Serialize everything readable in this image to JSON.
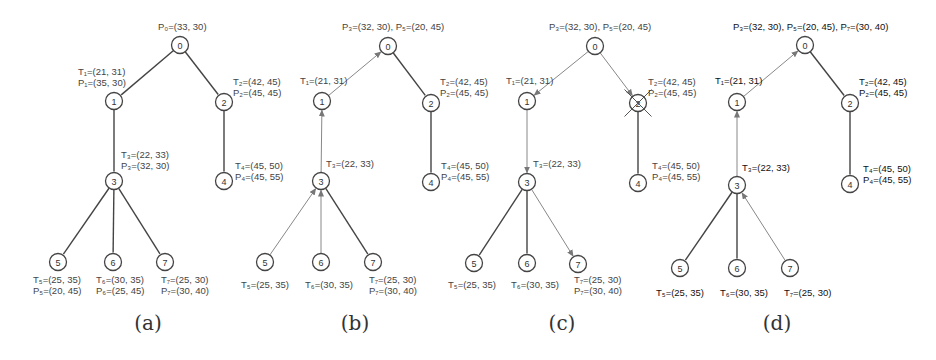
{
  "figure": {
    "panels": [
      {
        "id": "a",
        "caption": "(a)",
        "nodes": [
          {
            "id": "0",
            "x": 180,
            "y": 45
          },
          {
            "id": "1",
            "x": 114,
            "y": 101
          },
          {
            "id": "2",
            "x": 224,
            "y": 102
          },
          {
            "id": "3",
            "x": 114,
            "y": 181
          },
          {
            "id": "4",
            "x": 224,
            "y": 181
          },
          {
            "id": "5",
            "x": 58,
            "y": 262
          },
          {
            "id": "6",
            "x": 113,
            "y": 262
          },
          {
            "id": "7",
            "x": 165,
            "y": 262
          }
        ],
        "edges": [
          {
            "from": "0",
            "to": "1",
            "style": "solid"
          },
          {
            "from": "0",
            "to": "2",
            "style": "solid"
          },
          {
            "from": "1",
            "to": "3",
            "style": "solid"
          },
          {
            "from": "2",
            "to": "4",
            "style": "solid"
          },
          {
            "from": "3",
            "to": "5",
            "style": "solid"
          },
          {
            "from": "3",
            "to": "6",
            "style": "solid"
          },
          {
            "from": "3",
            "to": "7",
            "style": "solid"
          }
        ],
        "labels": [
          {
            "lines": [
              "P₀=(33, 30)"
            ],
            "x": 158,
            "y": 30
          },
          {
            "lines": [
              "T₁=(21, 31)",
              "P₁=(35, 30)"
            ],
            "x": 78,
            "y": 75
          },
          {
            "lines": [
              "T₂=(42, 45)",
              "P₂=(45, 45)"
            ],
            "x": 233,
            "y": 85
          },
          {
            "lines": [
              "T₃=(22, 33)",
              "P₃=(32, 30)"
            ],
            "x": 121,
            "y": 158
          },
          {
            "lines": [
              "T₄=(45, 50)",
              "P₄=(45, 55)"
            ],
            "x": 235,
            "y": 169
          },
          {
            "lines": [
              "T₅=(25, 35)",
              "P₅=(20, 45)"
            ],
            "x": 33,
            "y": 283
          },
          {
            "lines": [
              "T₆=(30, 35)",
              "P₆=(25, 45)"
            ],
            "x": 96,
            "y": 283
          },
          {
            "lines": [
              "T₇=(25, 30)",
              "P₇=(30, 40)"
            ],
            "x": 161,
            "y": 283
          }
        ],
        "crossed_node": null,
        "bold_labels": false
      },
      {
        "id": "b",
        "caption": "(b)",
        "nodes": [
          {
            "id": "0",
            "x": 388,
            "y": 46
          },
          {
            "id": "1",
            "x": 322,
            "y": 101
          },
          {
            "id": "2",
            "x": 431,
            "y": 103
          },
          {
            "id": "3",
            "x": 321,
            "y": 181
          },
          {
            "id": "4",
            "x": 431,
            "y": 182
          },
          {
            "id": "5",
            "x": 265,
            "y": 262
          },
          {
            "id": "6",
            "x": 321,
            "y": 262
          },
          {
            "id": "7",
            "x": 373,
            "y": 262
          }
        ],
        "edges": [
          {
            "from": "1",
            "to": "0",
            "style": "arrow"
          },
          {
            "from": "0",
            "to": "2",
            "style": "solid"
          },
          {
            "from": "3",
            "to": "1",
            "style": "arrow"
          },
          {
            "from": "2",
            "to": "4",
            "style": "solid"
          },
          {
            "from": "5",
            "to": "3",
            "style": "arrow"
          },
          {
            "from": "6",
            "to": "3",
            "style": "arrow"
          },
          {
            "from": "3",
            "to": "7",
            "style": "solid"
          }
        ],
        "labels": [
          {
            "lines": [
              "P₃=(32, 30), P₅=(20, 45)"
            ],
            "x": 342,
            "y": 30
          },
          {
            "lines": [
              "T₁=(21, 31)"
            ],
            "x": 300,
            "y": 84
          },
          {
            "lines": [
              "T₂=(42, 45)",
              "P₂=(45, 45)"
            ],
            "x": 440,
            "y": 85
          },
          {
            "lines": [
              "T₃=(22, 33)"
            ],
            "x": 326,
            "y": 167
          },
          {
            "lines": [
              "T₄=(45, 50)",
              "P₄=(45, 55)"
            ],
            "x": 441,
            "y": 169
          },
          {
            "lines": [
              "T₅=(25, 35)"
            ],
            "x": 241,
            "y": 288
          },
          {
            "lines": [
              "T₆=(30, 35)"
            ],
            "x": 305,
            "y": 288
          },
          {
            "lines": [
              "T₇=(25, 30)",
              "P₇=(30, 40)"
            ],
            "x": 369,
            "y": 283
          }
        ],
        "crossed_node": null,
        "bold_labels": false
      },
      {
        "id": "c",
        "caption": "(c)",
        "nodes": [
          {
            "id": "0",
            "x": 595,
            "y": 46
          },
          {
            "id": "1",
            "x": 527,
            "y": 101
          },
          {
            "id": "2",
            "x": 638,
            "y": 103
          },
          {
            "id": "3",
            "x": 527,
            "y": 182
          },
          {
            "id": "4",
            "x": 638,
            "y": 183
          },
          {
            "id": "5",
            "x": 474,
            "y": 263
          },
          {
            "id": "6",
            "x": 527,
            "y": 263
          },
          {
            "id": "7",
            "x": 578,
            "y": 264
          }
        ],
        "edges": [
          {
            "from": "0",
            "to": "1",
            "style": "arrow"
          },
          {
            "from": "0",
            "to": "2",
            "style": "arrow"
          },
          {
            "from": "1",
            "to": "3",
            "style": "arrow"
          },
          {
            "from": "2",
            "to": "4",
            "style": "solid"
          },
          {
            "from": "3",
            "to": "5",
            "style": "solid"
          },
          {
            "from": "3",
            "to": "6",
            "style": "solid"
          },
          {
            "from": "3",
            "to": "7",
            "style": "arrow"
          }
        ],
        "labels": [
          {
            "lines": [
              "P₃=(32, 30), P₅=(20, 45)"
            ],
            "x": 549,
            "y": 30
          },
          {
            "lines": [
              "T₁=(21, 31)"
            ],
            "x": 506,
            "y": 84
          },
          {
            "lines": [
              "T₂=(42, 45)",
              "P₂=(45, 45)"
            ],
            "x": 648,
            "y": 85
          },
          {
            "lines": [
              "T₃=(22, 33)"
            ],
            "x": 533,
            "y": 167
          },
          {
            "lines": [
              "T₄=(45, 50)",
              "P₄=(45, 55)"
            ],
            "x": 652,
            "y": 169
          },
          {
            "lines": [
              "T₅=(25, 35)"
            ],
            "x": 448,
            "y": 288
          },
          {
            "lines": [
              "T₆=(30, 35)"
            ],
            "x": 511,
            "y": 288
          },
          {
            "lines": [
              "T₇=(25, 30)",
              "P₇=(30, 40)"
            ],
            "x": 574,
            "y": 283
          }
        ],
        "crossed_node": "2",
        "bold_labels": false
      },
      {
        "id": "d",
        "caption": "(d)",
        "nodes": [
          {
            "id": "0",
            "x": 805,
            "y": 45
          },
          {
            "id": "1",
            "x": 737,
            "y": 102
          },
          {
            "id": "2",
            "x": 850,
            "y": 103
          },
          {
            "id": "3",
            "x": 737,
            "y": 185
          },
          {
            "id": "4",
            "x": 850,
            "y": 184
          },
          {
            "id": "5",
            "x": 680,
            "y": 268
          },
          {
            "id": "6",
            "x": 737,
            "y": 268
          },
          {
            "id": "7",
            "x": 790,
            "y": 268
          }
        ],
        "edges": [
          {
            "from": "1",
            "to": "0",
            "style": "arrow"
          },
          {
            "from": "0",
            "to": "2",
            "style": "solid"
          },
          {
            "from": "3",
            "to": "1",
            "style": "arrow"
          },
          {
            "from": "2",
            "to": "4",
            "style": "solid"
          },
          {
            "from": "3",
            "to": "5",
            "style": "solid"
          },
          {
            "from": "3",
            "to": "6",
            "style": "solid"
          },
          {
            "from": "7",
            "to": "3",
            "style": "arrow"
          }
        ],
        "labels": [
          {
            "lines": [
              "P₃=(32, 30), P₅=(20, 45), P₇=(30, 40)"
            ],
            "x": 733,
            "y": 30
          },
          {
            "lines": [
              "T₁=(21, 31)"
            ],
            "x": 715,
            "y": 84
          },
          {
            "lines": [
              "T₂=(42, 45)",
              "P₂=(45, 45)"
            ],
            "x": 859,
            "y": 85
          },
          {
            "lines": [
              "T₃=(22, 33)"
            ],
            "x": 742,
            "y": 171
          },
          {
            "lines": [
              "T₄=(45, 50)",
              "P₄=(45, 55)"
            ],
            "x": 863,
            "y": 172
          },
          {
            "lines": [
              "T₅=(25, 35)"
            ],
            "x": 656,
            "y": 296
          },
          {
            "lines": [
              "T₆=(30, 35)"
            ],
            "x": 720,
            "y": 296
          },
          {
            "lines": [
              "T₇=(25, 30)"
            ],
            "x": 784,
            "y": 296
          }
        ],
        "crossed_node": null,
        "bold_labels": true
      }
    ],
    "captions_y": 330,
    "caption_positions": [
      148,
      355,
      562,
      777
    ],
    "colors": {
      "tree_edge": "#444444",
      "message_edge": "#888888",
      "node_stroke": "#444444",
      "text": "#333333"
    }
  }
}
